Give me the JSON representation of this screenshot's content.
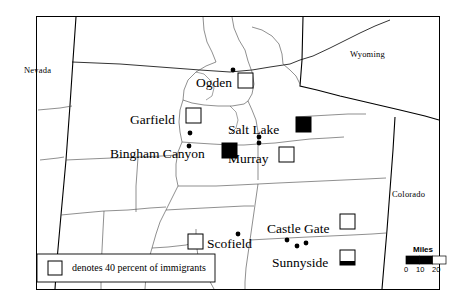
{
  "figure": {
    "type": "thematic-point-map",
    "region": "Utah",
    "background_color": "#ffffff",
    "line_color": "#000000",
    "border": {
      "x": 36,
      "y": 16,
      "width": 404,
      "height": 274
    }
  },
  "state_labels": [
    {
      "name": "nevada",
      "text": "Nevada",
      "x": 24,
      "y": 66
    },
    {
      "name": "wyoming",
      "text": "Wyoming",
      "x": 350,
      "y": 50
    },
    {
      "name": "colorado",
      "text": "Colorado",
      "x": 392,
      "y": 190
    }
  ],
  "cities": [
    {
      "name": "ogden",
      "label": "Ogden",
      "label_x": 196,
      "label_y": 76,
      "dot_x": 233,
      "dot_y": 70,
      "marker": {
        "type": "square",
        "fill": "open",
        "x": 238,
        "y": 73,
        "size": 15
      }
    },
    {
      "name": "garfield",
      "label": "Garfield",
      "label_x": 130,
      "label_y": 113,
      "dot_x": 190,
      "dot_y": 133,
      "marker": {
        "type": "square",
        "fill": "open",
        "x": 186,
        "y": 108,
        "size": 15
      }
    },
    {
      "name": "salt-lake",
      "label": "Salt Lake",
      "label_x": 228,
      "label_y": 123,
      "dot_x": 297,
      "dot_y": 137,
      "marker": {
        "type": "square",
        "fill": "solid",
        "x": 296,
        "y": 117,
        "size": 15
      }
    },
    {
      "name": "bingham-canyon",
      "label": "Bingham Canyon",
      "label_x": 110,
      "label_y": 147,
      "dot_x": 189,
      "dot_y": 146,
      "marker": {
        "type": "square",
        "fill": "solid",
        "x": 222,
        "y": 143,
        "size": 15
      }
    },
    {
      "name": "murray",
      "label": "Murray",
      "label_x": 228,
      "label_y": 152,
      "dot_x": 259,
      "dot_y": 141,
      "marker": {
        "type": "square",
        "fill": "open",
        "x": 279,
        "y": 147,
        "size": 15
      }
    },
    {
      "name": "castle-gate",
      "label": "Castle Gate",
      "label_x": 267,
      "label_y": 222,
      "dot_x": 287,
      "dot_y": 240,
      "marker": {
        "type": "square",
        "fill": "open",
        "x": 340,
        "y": 214,
        "size": 15
      }
    },
    {
      "name": "scofield",
      "label": "Scofield",
      "label_x": 207,
      "label_y": 237,
      "dot_x": 238,
      "dot_y": 234,
      "marker": {
        "type": "square",
        "fill": "open",
        "x": 188,
        "y": 234,
        "size": 15
      }
    },
    {
      "name": "sunnyside",
      "label": "Sunnyside",
      "label_x": 272,
      "label_y": 256,
      "dot_x": 297,
      "dot_y": 246,
      "marker": {
        "type": "square",
        "fill": "partial-bottom",
        "x": 340,
        "y": 250,
        "size": 15
      }
    }
  ],
  "legend": {
    "name": "immigrant-legend",
    "box": {
      "x": 37,
      "y": 254,
      "width": 178,
      "height": 28
    },
    "swatch": {
      "x": 48,
      "y": 261,
      "size": 14,
      "fill": "open"
    },
    "text": "denotes 40 percent of immigrants"
  },
  "scale_bar": {
    "name": "scale-bar",
    "title": "Miles",
    "ticks": [
      "0",
      "10",
      "20"
    ],
    "x": 406,
    "y": 256,
    "width": 40,
    "height": 8,
    "segments": [
      "#000000",
      "#000000",
      "#ffffff"
    ]
  }
}
